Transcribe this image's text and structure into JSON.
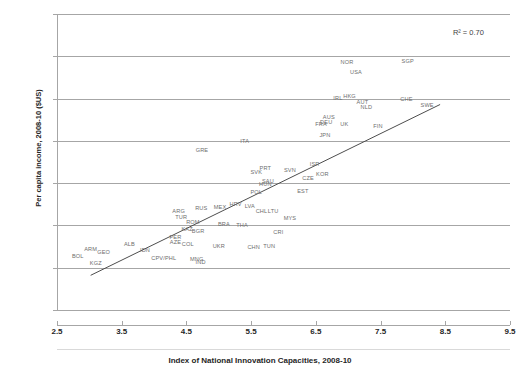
{
  "chart_data": {
    "type": "scatter",
    "title": "",
    "xlabel": "Index of National Innovation Capacities, 2008-10",
    "ylabel": "Per capita income, 2008-10 ($US)",
    "xlim": [
      2.5,
      9.5
    ],
    "ylim": [
      -10000,
      60000
    ],
    "xticks": [
      "2.5",
      "3.5",
      "4.5",
      "5.5",
      "6.5",
      "7.5",
      "8.5",
      "9.5"
    ],
    "xtick_values": [
      2.5,
      3.5,
      4.5,
      5.5,
      6.5,
      7.5,
      8.5,
      9.5
    ],
    "yticks": [
      "60000",
      "50000",
      "40000",
      "30000",
      "20000",
      "10000",
      "0",
      "-10000"
    ],
    "ytick_values": [
      60000,
      50000,
      40000,
      30000,
      20000,
      10000,
      0,
      -10000
    ],
    "grid": "horizontal",
    "legend": "none",
    "annotations": [
      {
        "text": "R² = 0.70",
        "x": 9.05,
        "y": 55500
      }
    ],
    "trendline": {
      "type": "linear",
      "r_squared": 0.7,
      "x_start": 3.02,
      "y_start": -1800,
      "x_end": 8.42,
      "y_end": 38600
    },
    "point_label_style": "country-iso3",
    "points": [
      {
        "label": "BOL",
        "x": 2.82,
        "y": 2700
      },
      {
        "label": "KGZ",
        "x": 3.1,
        "y": 1200
      },
      {
        "label": "ARM",
        "x": 3.02,
        "y": 4400
      },
      {
        "label": "GEO",
        "x": 3.22,
        "y": 3700
      },
      {
        "label": "ALB",
        "x": 3.62,
        "y": 5700
      },
      {
        "label": "IDN",
        "x": 3.86,
        "y": 4300
      },
      {
        "label": "CPV/PHL",
        "x": 4.15,
        "y": 2200
      },
      {
        "label": "MNG",
        "x": 4.66,
        "y": 2000
      },
      {
        "label": "IND",
        "x": 4.72,
        "y": 1300
      },
      {
        "label": "PER",
        "x": 4.33,
        "y": 7200
      },
      {
        "label": "AZE",
        "x": 4.33,
        "y": 6100
      },
      {
        "label": "COL",
        "x": 4.52,
        "y": 5700
      },
      {
        "label": "UKR",
        "x": 5.0,
        "y": 5200
      },
      {
        "label": "KAZ",
        "x": 4.51,
        "y": 9200
      },
      {
        "label": "BGR",
        "x": 4.68,
        "y": 8700
      },
      {
        "label": "ROM",
        "x": 4.6,
        "y": 10900
      },
      {
        "label": "TUR",
        "x": 4.42,
        "y": 12000
      },
      {
        "label": "ARG",
        "x": 4.38,
        "y": 13400
      },
      {
        "label": "RUS",
        "x": 4.73,
        "y": 14200
      },
      {
        "label": "MEX",
        "x": 5.02,
        "y": 14400
      },
      {
        "label": "BRA",
        "x": 5.08,
        "y": 10400
      },
      {
        "label": "CHN",
        "x": 5.54,
        "y": 5000
      },
      {
        "label": "TUN",
        "x": 5.78,
        "y": 5100
      },
      {
        "label": "CRI",
        "x": 5.92,
        "y": 8500
      },
      {
        "label": "THA",
        "x": 5.36,
        "y": 10000
      },
      {
        "label": "HRV",
        "x": 5.26,
        "y": 15000
      },
      {
        "label": "LVA",
        "x": 5.48,
        "y": 14700
      },
      {
        "label": "CHL",
        "x": 5.66,
        "y": 13400
      },
      {
        "label": "LTU",
        "x": 5.84,
        "y": 13500
      },
      {
        "label": "MYS",
        "x": 6.1,
        "y": 11800
      },
      {
        "label": "POL",
        "x": 5.58,
        "y": 17900
      },
      {
        "label": "HUN",
        "x": 5.72,
        "y": 19700
      },
      {
        "label": "SAU",
        "x": 5.76,
        "y": 20500
      },
      {
        "label": "SVK",
        "x": 5.58,
        "y": 22600
      },
      {
        "label": "PRT",
        "x": 5.72,
        "y": 23500
      },
      {
        "label": "EST",
        "x": 6.3,
        "y": 18100
      },
      {
        "label": "CZE",
        "x": 6.38,
        "y": 21200
      },
      {
        "label": "SVN",
        "x": 6.1,
        "y": 23100
      },
      {
        "label": "KOR",
        "x": 6.6,
        "y": 22100
      },
      {
        "label": "ISR",
        "x": 6.48,
        "y": 24500
      },
      {
        "label": "GRE",
        "x": 4.74,
        "y": 27800
      },
      {
        "label": "ITA",
        "x": 5.4,
        "y": 30000
      },
      {
        "label": "JPN",
        "x": 6.64,
        "y": 31500
      },
      {
        "label": "FRA",
        "x": 6.58,
        "y": 33900
      },
      {
        "label": "DEU",
        "x": 6.66,
        "y": 34400
      },
      {
        "label": "AUS",
        "x": 6.7,
        "y": 35700
      },
      {
        "label": "UK",
        "x": 6.94,
        "y": 34000
      },
      {
        "label": "NLD",
        "x": 7.28,
        "y": 37900
      },
      {
        "label": "FIN",
        "x": 7.46,
        "y": 33500
      },
      {
        "label": "AUT",
        "x": 7.22,
        "y": 39100
      },
      {
        "label": "IRL",
        "x": 6.84,
        "y": 40100
      },
      {
        "label": "HKG",
        "x": 7.02,
        "y": 40700
      },
      {
        "label": "CHE",
        "x": 7.9,
        "y": 39900
      },
      {
        "label": "SWE",
        "x": 8.22,
        "y": 38400
      },
      {
        "label": "USA",
        "x": 7.12,
        "y": 46400
      },
      {
        "label": "NOR",
        "x": 6.98,
        "y": 48600
      },
      {
        "label": "SGP",
        "x": 7.92,
        "y": 48800
      }
    ]
  }
}
